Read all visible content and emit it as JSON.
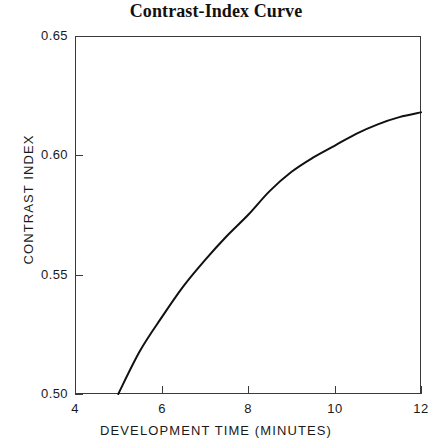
{
  "chart_data": {
    "type": "line",
    "title": "Contrast-Index Curve",
    "xlabel": "DEVELOPMENT TIME (MINUTES)",
    "ylabel": "CONTRAST INDEX",
    "xlim": [
      4,
      12
    ],
    "ylim": [
      0.5,
      0.65
    ],
    "xticks": [
      4,
      6,
      8,
      10,
      12
    ],
    "xtick_labels": [
      "4",
      "6",
      "8",
      "10",
      "12"
    ],
    "yticks": [
      0.5,
      0.55,
      0.6,
      0.65
    ],
    "ytick_labels": [
      "0.50",
      "0.55",
      "0.60",
      "0.65"
    ],
    "grid": false,
    "legend": "none",
    "series": [
      {
        "name": "HC-110 (Dil B)",
        "annotation": "HC-110 (Dil B)",
        "color": "#111111",
        "x": [
          5.0,
          5.5,
          6.0,
          6.5,
          7.0,
          7.5,
          8.0,
          8.5,
          9.0,
          9.5,
          10.0,
          10.5,
          11.0,
          11.5,
          12.0
        ],
        "y": [
          0.5,
          0.518,
          0.532,
          0.545,
          0.556,
          0.566,
          0.575,
          0.585,
          0.593,
          0.599,
          0.604,
          0.609,
          0.613,
          0.616,
          0.618
        ]
      }
    ]
  },
  "axes": {
    "x_title": "DEVELOPMENT TIME (MINUTES)",
    "y_title": "CONTRAST INDEX"
  },
  "title": "Contrast-Index Curve",
  "curve_annotation": "HC-110 (Dil B)",
  "colors": {
    "curve": "#111111",
    "frame": "#3a3a3a",
    "text": "#1a1a1a",
    "background": "#ffffff"
  }
}
